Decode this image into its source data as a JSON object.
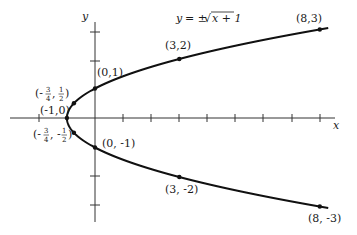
{
  "chart_data": {
    "type": "line",
    "title": "",
    "equation": "y = ± √(x + 1)",
    "equation_parts": {
      "lhs": "y",
      "op": "= ±",
      "radicand": "x + 1"
    },
    "xlabel": "x",
    "ylabel": "y",
    "xlim": [
      -3,
      9
    ],
    "ylim": [
      -4,
      4
    ],
    "x_ticks": [
      -2,
      -1,
      1,
      2,
      3,
      4,
      5,
      6,
      7,
      8
    ],
    "y_ticks": [
      -3,
      -2,
      2,
      3
    ],
    "grid": false,
    "legend": "none",
    "series": [
      {
        "name": "upper branch y = +√(x+1)",
        "x": [
          -1,
          -0.75,
          0,
          3,
          8
        ],
        "y": [
          0,
          0.5,
          1,
          2,
          3
        ]
      },
      {
        "name": "lower branch y = -√(x+1)",
        "x": [
          -1,
          -0.75,
          0,
          3,
          8
        ],
        "y": [
          0,
          -0.5,
          -1,
          -2,
          -3
        ]
      }
    ],
    "annotations": [
      {
        "label": "(-1,0)",
        "x": -1,
        "y": 0
      },
      {
        "label": "(-3/4, 1/2)",
        "x": -0.75,
        "y": 0.5
      },
      {
        "label": "(-3/4, -1/2)",
        "x": -0.75,
        "y": -0.5
      },
      {
        "label": "(0,1)",
        "x": 0,
        "y": 1
      },
      {
        "label": "(0, -1)",
        "x": 0,
        "y": -1
      },
      {
        "label": "(3,2)",
        "x": 3,
        "y": 2
      },
      {
        "label": "(3, -2)",
        "x": 3,
        "y": -2
      },
      {
        "label": "(8,3)",
        "x": 8,
        "y": 3
      },
      {
        "label": "(8, -3)",
        "x": 8,
        "y": -3
      }
    ]
  },
  "labels": {
    "x_axis": "x",
    "y_axis": "y",
    "eq_y": "y",
    "eq_op": "= ±",
    "eq_radicand": "x + 1",
    "p_vertex": "(-1,0)",
    "p_0_1": "(0,1)",
    "p_0_m1": "(0, -1)",
    "p_3_2": "(3,2)",
    "p_3_m2": "(3, -2)",
    "p_8_3": "(8,3)",
    "p_8_m3": "(8, -3)",
    "frac_open": "(-",
    "frac_three": "3",
    "frac_four": "4",
    "frac_one": "1",
    "frac_two": "2",
    "frac_comma": ",",
    "frac_comma_neg": ", -",
    "frac_close": ")"
  }
}
